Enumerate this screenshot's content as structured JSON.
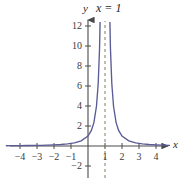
{
  "figure": {
    "background_color": "#ffffff",
    "axis_color": "#4a4a4a",
    "curve_color": "#5b5b96",
    "asymptote_color": "#8a8a72",
    "label_color": "#3a3a3a"
  },
  "labels": {
    "y_axis_name": "y",
    "x_axis_name": "x",
    "asymptote_equation": "x = 1"
  },
  "chart_data": {
    "type": "line",
    "title": "",
    "subtitle": "",
    "xlabel": "x",
    "ylabel": "y",
    "xlim": [
      -4.8,
      4.8
    ],
    "ylim": [
      -3,
      13.5
    ],
    "grid": false,
    "legend": null,
    "x_ticks": [
      -4,
      -3,
      -2,
      -1,
      1,
      2,
      3,
      4
    ],
    "x_tick_labels": [
      "−4",
      "−3",
      "−2",
      "−1",
      "1",
      "2",
      "3",
      "4"
    ],
    "y_ticks": [
      -2,
      2,
      4,
      6,
      8,
      10,
      12
    ],
    "y_tick_labels": [
      "−2",
      "2",
      "4",
      "6",
      "8",
      "10",
      "12"
    ],
    "annotations": [
      {
        "text": "x = 1",
        "type": "vertical-asymptote-label",
        "x": 1,
        "y": 13.4
      }
    ],
    "asymptotes": [
      {
        "type": "vertical",
        "x": 1,
        "style": "dashed",
        "label": "x = 1"
      },
      {
        "type": "horizontal",
        "y": 0,
        "style": "implied"
      }
    ],
    "series": [
      {
        "name": "left-branch",
        "style": "solid",
        "x": [
          -4.8,
          -4.4,
          -4.0,
          -3.6,
          -3.2,
          -2.8,
          -2.4,
          -2.0,
          -1.6,
          -1.2,
          -0.8,
          -0.4,
          0.0,
          0.2,
          0.35,
          0.5,
          0.6,
          0.68,
          0.74,
          0.78,
          0.82,
          0.85,
          0.873
        ],
        "y": [
          0.0295,
          0.0343,
          0.04,
          0.0473,
          0.0567,
          0.0693,
          0.0865,
          0.1111,
          0.1479,
          0.2066,
          0.3086,
          0.5102,
          1.0,
          1.5625,
          2.3669,
          4.0,
          6.25,
          9.766,
          14.793,
          20.66,
          30.86,
          44.44,
          62.0
        ]
      },
      {
        "name": "right-branch",
        "style": "solid",
        "x": [
          1.127,
          1.15,
          1.18,
          1.22,
          1.26,
          1.32,
          1.4,
          1.5,
          1.65,
          1.8,
          2.0,
          2.4,
          2.8,
          3.2,
          3.6,
          4.0,
          4.4,
          4.8
        ],
        "y": [
          62.0,
          44.44,
          30.86,
          20.66,
          14.793,
          9.766,
          6.25,
          4.0,
          2.3669,
          1.5625,
          1.0,
          0.5102,
          0.3086,
          0.2066,
          0.1479,
          0.1111,
          0.0865,
          0.0693
        ]
      }
    ],
    "equation_form": "y = 1/(x - 1)^2"
  }
}
